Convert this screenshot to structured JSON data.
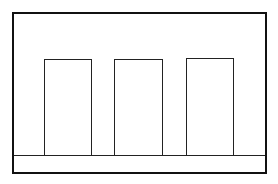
{
  "diagram": {
    "stroke_color": "#111111",
    "background": "#ffffff",
    "elements": [
      {
        "name": "rectangle-1"
      },
      {
        "name": "rectangle-2"
      },
      {
        "name": "rectangle-3"
      }
    ]
  }
}
